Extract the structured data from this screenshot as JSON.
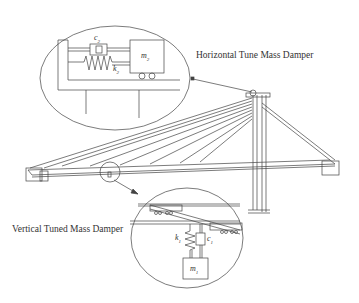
{
  "figure": {
    "labels": {
      "horizontal_tmd": "Horizontal Tune Mass Damper",
      "vertical_tmd": "Vertical Tuned Mass Damper"
    },
    "horizontal_detail": {
      "damper": "c",
      "damper_sub": "2",
      "spring": "k",
      "spring_sub": "2",
      "mass": "m",
      "mass_sub": "2"
    },
    "vertical_detail": {
      "spring": "k",
      "spring_sub": "1",
      "damper": "c",
      "damper_sub": "1",
      "mass": "m",
      "mass_sub": "1"
    },
    "colors": {
      "line": "#444444",
      "background": "#ffffff"
    }
  }
}
